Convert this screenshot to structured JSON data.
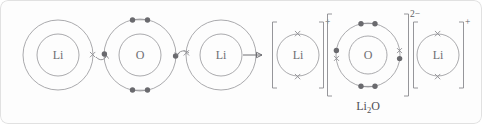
{
  "figure": {
    "name": "lithium-oxide-ionic-bonding-dot-cross-diagram",
    "background_color": "#fdfdfd",
    "line_color": "#a0a0a4",
    "dot_color": "#6a6a6e",
    "cross_color": "#8d8d92",
    "text_color": "#6e6e73"
  },
  "reactants": {
    "lithium_left": {
      "symbol": "Li",
      "shells": 2,
      "outer_electrons": 1,
      "electron_mark": "cross"
    },
    "oxygen": {
      "symbol": "O",
      "shells": 2,
      "outer_electrons": 6,
      "electron_mark": "dot"
    },
    "lithium_right": {
      "symbol": "Li",
      "shells": 2,
      "outer_electrons": 1,
      "electron_mark": "cross"
    }
  },
  "reaction_arrow": {
    "glyph": "arrow-right",
    "label": ""
  },
  "products": {
    "lithium_ion_left": {
      "symbol": "Li",
      "charge": "+",
      "shells": 1,
      "outer_electrons": 2,
      "electron_mark": "cross"
    },
    "oxide_ion": {
      "symbol": "O",
      "charge": "2−",
      "shells": 2,
      "outer_electrons": 8,
      "electron_mark": "dot-and-cross"
    },
    "lithium_ion_right": {
      "symbol": "Li",
      "charge": "+",
      "shells": 1,
      "outer_electrons": 2,
      "electron_mark": "cross"
    }
  },
  "caption": {
    "formula_prefix": "Li",
    "formula_subscript": "2",
    "formula_suffix": "O",
    "full_text": "Li2O"
  }
}
